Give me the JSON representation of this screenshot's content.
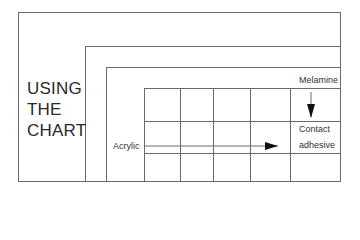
{
  "title": {
    "line1": "USING",
    "line2": "THE",
    "line3": "CHART"
  },
  "labels": {
    "row_label": "Acrylic",
    "column_label": "Melamine",
    "intersection_line1": "Contact",
    "intersection_line2": "adhesive"
  },
  "colors": {
    "lines": "#6a6a6a",
    "text": "#2a2a2a",
    "arrow": "#111111"
  }
}
